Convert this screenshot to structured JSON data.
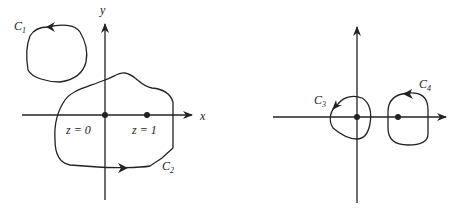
{
  "left_figure": {
    "x_axis_label": "x",
    "y_axis_label": "y",
    "points": [
      {
        "label": "z = 0",
        "position": "origin"
      },
      {
        "label": "z = 1",
        "position": "x = 1"
      }
    ],
    "contours": [
      {
        "name": "C",
        "subscript": "1",
        "orientation": "counterclockwise",
        "encloses": "none"
      },
      {
        "name": "C",
        "subscript": "2",
        "orientation": "counterclockwise",
        "encloses": "z = 0 and z = 1"
      }
    ]
  },
  "right_figure": {
    "points": [
      {
        "position": "origin"
      },
      {
        "position": "x = 1"
      }
    ],
    "contours": [
      {
        "name": "C",
        "subscript": "3",
        "orientation": "counterclockwise",
        "encloses": "z = 0"
      },
      {
        "name": "C",
        "subscript": "4",
        "orientation": "counterclockwise",
        "encloses": "z = 1"
      }
    ]
  },
  "colors": {
    "ink": "#222222",
    "background": "#ffffff"
  }
}
